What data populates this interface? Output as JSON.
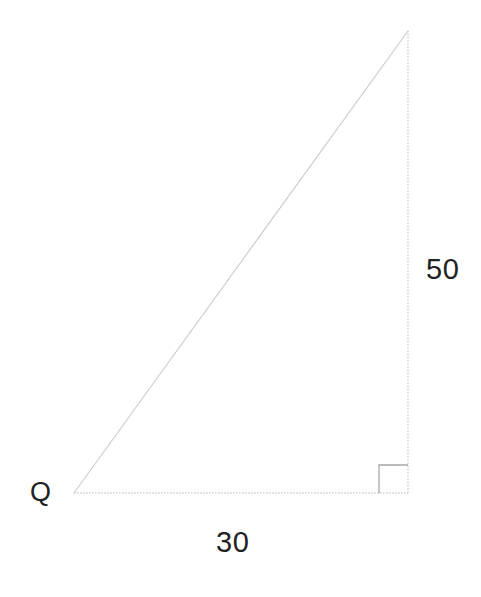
{
  "figure": {
    "kind": "right-triangle-diagram",
    "background_color": "#ffffff",
    "line_color": "#c2c2c2",
    "text_color": "#222222",
    "canvas": {
      "width": 481,
      "height": 597
    }
  },
  "labels": {
    "vertex_q": "Q",
    "side_vertical": "50",
    "side_horizontal": "30"
  },
  "geometry": {
    "vertices": {
      "q": {
        "x": 74,
        "y": 493
      },
      "right_angle": {
        "x": 408,
        "y": 493
      },
      "apex": {
        "x": 408,
        "y": 31
      }
    },
    "sides": [
      {
        "name": "base",
        "from": "q",
        "to": "right_angle",
        "label": "30",
        "style": "dotted"
      },
      {
        "name": "vertical",
        "from": "right_angle",
        "to": "apex",
        "label": "50",
        "style": "dotted"
      },
      {
        "name": "hypotenuse",
        "from": "q",
        "to": "apex",
        "label": "",
        "style": "solid-faint"
      }
    ],
    "right_angle_marker": {
      "x": 379,
      "y": 465,
      "width": 29,
      "height": 28,
      "at_vertex": "right_angle"
    }
  }
}
